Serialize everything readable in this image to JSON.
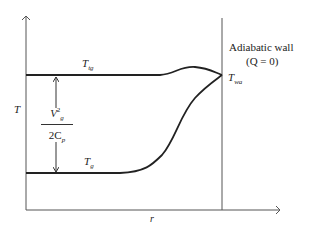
{
  "diagram": {
    "y_axis_label": "T",
    "x_axis_label": "r",
    "curves": [
      {
        "name": "T",
        "subscript": "tg",
        "description": "total gas temperature, flat then slight bump, meeting wall"
      },
      {
        "name": "T",
        "subscript": "g",
        "description": "static gas temperature, flat then rising S-curve to wall"
      }
    ],
    "wall_label": "Adiabatic wall",
    "wall_condition": "(Q = 0)",
    "wall_temperature": {
      "name": "T",
      "subscript": "wa"
    },
    "difference_label": {
      "numerator": "V",
      "numerator_sub": "g",
      "numerator_sup": "2",
      "denominator": "2C",
      "denominator_sub": "p"
    },
    "colors": {
      "line": "#222222",
      "axis": "#555555"
    }
  }
}
